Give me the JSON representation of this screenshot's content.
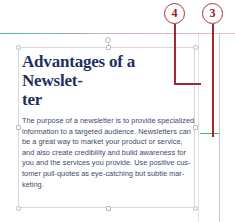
{
  "document": {
    "title_line_1": "Advantages of a Newslet-",
    "title_line_2": "ter",
    "body_lines": [
      "The purpose of a newsletter is to provide specialized",
      "information to a targeted audience. Newsletters can",
      "be a great way to market your product or service,",
      "and also create credibility and build awareness for",
      "you and the services you provide. Use positive cus-",
      "tomer pull-quotes as eye-catching but subtle mar-",
      "keting."
    ]
  },
  "annotations": {
    "callout_4": "4",
    "callout_3": "3"
  },
  "colors": {
    "title": "#1f2f5e",
    "body": "#3e4a6b",
    "callout_border": "#a83242",
    "callout_text": "#8e2230",
    "leader_line": "#9e2b33",
    "guide_teal": "#3bbfa8",
    "guide_pink": "#f0b6c2",
    "guide_green": "#3cb878",
    "handle_border": "#b9b9c4",
    "textbox_border": "#d8d8dd"
  }
}
